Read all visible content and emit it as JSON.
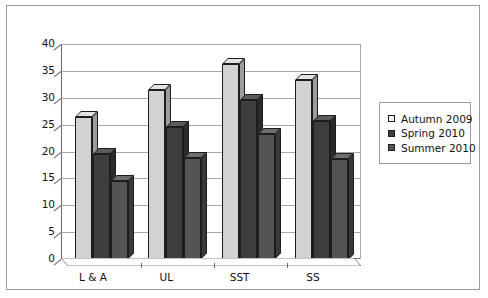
{
  "chart_data": {
    "type": "bar",
    "title": "",
    "subtitle": "",
    "xlabel": "",
    "ylabel": "",
    "ylim": [
      0,
      40
    ],
    "yticks": [
      0,
      5,
      10,
      15,
      20,
      25,
      30,
      35,
      40
    ],
    "ytick_labels": [
      "0",
      "5",
      "10",
      "15",
      "20",
      "25",
      "30",
      "35",
      "40"
    ],
    "grid": true,
    "legend_position": "right",
    "style": "3d-grouped-bar",
    "categories": [
      "L & A",
      "UL",
      "SST",
      "SS"
    ],
    "series": [
      {
        "name": "Autumn 2009",
        "color": "#d2d2d2",
        "top_color": "#e4e4e4",
        "side_color": "#9c9c9c",
        "values": [
          26.5,
          31.5,
          36.3,
          33.3
        ]
      },
      {
        "name": "Spring 2010",
        "color": "#3d3d3d",
        "top_color": "#5c5c5c",
        "side_color": "#2a2a2a",
        "values": [
          19.5,
          24.5,
          29.5,
          25.7
        ]
      },
      {
        "name": "Summer 2010",
        "color": "#545454",
        "top_color": "#6e6e6e",
        "side_color": "#3a3a3a",
        "values": [
          14.5,
          18.8,
          23.3,
          18.7
        ]
      }
    ]
  },
  "legend": {
    "items": [
      {
        "label": "Autumn 2009",
        "swatch": "#f2f2f2"
      },
      {
        "label": "Spring 2010",
        "swatch": "#3d3d3d"
      },
      {
        "label": "Summer 2010",
        "swatch": "#545454"
      }
    ]
  },
  "axis": {
    "y_labels": [
      "40",
      "35",
      "30",
      "25",
      "20",
      "15",
      "10",
      "5",
      "0"
    ],
    "x_labels": [
      "L & A",
      "UL",
      "SST",
      "SS"
    ]
  }
}
